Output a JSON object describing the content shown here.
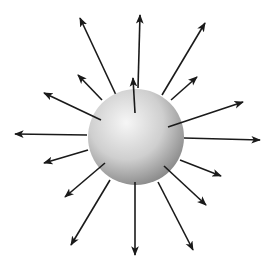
{
  "diagram": {
    "title": "",
    "colors": {
      "background": "#ffffff",
      "arrow": "#1a1a1a",
      "sphere_light": "#f4f4f4",
      "sphere_mid": "#c8c8c8",
      "sphere_dark": "#8a8a8a"
    },
    "sphere": {
      "cx": 136,
      "cy": 137,
      "r": 48
    },
    "arrows": [
      {
        "x1": 116,
        "y1": 95,
        "x2": 80,
        "y2": 18
      },
      {
        "x1": 138,
        "y1": 88,
        "x2": 140,
        "y2": 15
      },
      {
        "x1": 162,
        "y1": 95,
        "x2": 205,
        "y2": 23
      },
      {
        "x1": 102,
        "y1": 100,
        "x2": 78,
        "y2": 75
      },
      {
        "x1": 135,
        "y1": 113,
        "x2": 133,
        "y2": 78
      },
      {
        "x1": 171,
        "y1": 100,
        "x2": 197,
        "y2": 77
      },
      {
        "x1": 101,
        "y1": 120,
        "x2": 44,
        "y2": 93
      },
      {
        "x1": 168,
        "y1": 127,
        "x2": 243,
        "y2": 102
      },
      {
        "x1": 87,
        "y1": 135,
        "x2": 15,
        "y2": 134
      },
      {
        "x1": 184,
        "y1": 138,
        "x2": 260,
        "y2": 140
      },
      {
        "x1": 88,
        "y1": 150,
        "x2": 44,
        "y2": 163
      },
      {
        "x1": 180,
        "y1": 160,
        "x2": 221,
        "y2": 176
      },
      {
        "x1": 105,
        "y1": 163,
        "x2": 65,
        "y2": 197
      },
      {
        "x1": 164,
        "y1": 166,
        "x2": 206,
        "y2": 205
      },
      {
        "x1": 110,
        "y1": 180,
        "x2": 71,
        "y2": 245
      },
      {
        "x1": 135,
        "y1": 182,
        "x2": 135,
        "y2": 255
      },
      {
        "x1": 158,
        "y1": 182,
        "x2": 193,
        "y2": 250
      }
    ]
  }
}
